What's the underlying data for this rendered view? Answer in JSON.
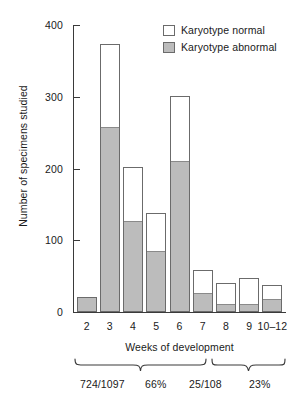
{
  "chart_data": {
    "type": "bar",
    "title": "",
    "subtitle": "",
    "xlabel": "Weeks of development",
    "ylabel": "Number of specimens studied",
    "ylim": [
      0,
      400
    ],
    "yticks": [
      0,
      100,
      200,
      300,
      400
    ],
    "ytick_labels": [
      "0",
      "100",
      "200",
      "300",
      "400"
    ],
    "grid": false,
    "stacked": true,
    "legend_position": "top-right",
    "categories": [
      "2",
      "3",
      "4",
      "5",
      "6",
      "7",
      "8",
      "9",
      "10–12"
    ],
    "series": [
      {
        "name": "Karyotype abnormal",
        "color": "#bcbcbc",
        "values": [
          19,
          256,
          125,
          84,
          209,
          25,
          10,
          10,
          17
        ]
      },
      {
        "name": "Karyotype normal",
        "color": "#ffffff",
        "values": [
          2,
          117,
          77,
          54,
          92,
          33,
          30,
          37,
          20
        ]
      }
    ],
    "totals": [
      21,
      373,
      202,
      138,
      301,
      58,
      40,
      47,
      37
    ],
    "annotations": [
      {
        "id": "brace-early",
        "label_ratio": "724/1097",
        "label_percent": "66%",
        "spans": [
          "2",
          "3",
          "4",
          "5",
          "6",
          "7"
        ]
      },
      {
        "id": "brace-late",
        "label_ratio": "25/108",
        "label_percent": "23%",
        "spans": [
          "8",
          "9",
          "10–12"
        ]
      }
    ]
  },
  "legend": {
    "items": [
      {
        "label": "Karyotype normal",
        "swatch": "white"
      },
      {
        "label": "Karyotype abnormal",
        "swatch": "gray"
      }
    ]
  },
  "axes": {
    "y_title": "Number of specimens studied",
    "x_title": "Weeks of development"
  },
  "colors": {
    "abnormal_fill": "#bcbcbc",
    "normal_fill": "#ffffff",
    "bar_outline": "#6b6b6b",
    "axis": "#3a3a3a",
    "text": "#1a1a1a"
  }
}
